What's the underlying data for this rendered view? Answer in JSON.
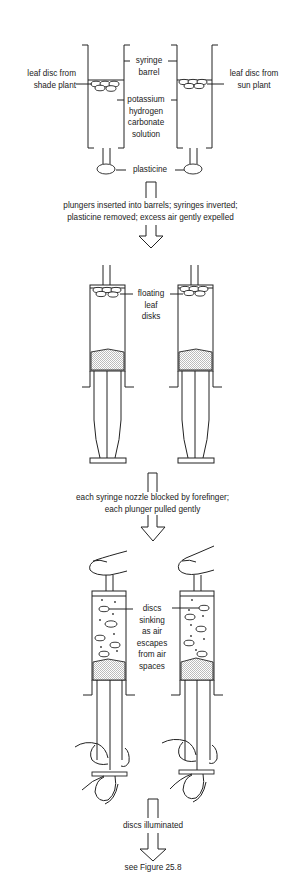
{
  "stage1": {
    "label_left_1": "leaf disc from",
    "label_left_2": "shade plant",
    "label_right_1": "leaf disc from",
    "label_right_2": "sun plant",
    "label_barrel_1": "syringe",
    "label_barrel_2": "barrel",
    "label_solution_1": "potassium",
    "label_solution_2": "hydrogen",
    "label_solution_3": "carbonate",
    "label_solution_4": "solution",
    "label_plasticine": "plasticine"
  },
  "step1": {
    "line1": "plungers inserted into barrels; syringes inverted;",
    "line2": "plasticine removed; excess air gently expelled"
  },
  "stage2": {
    "label_1": "floating",
    "label_2": "leaf",
    "label_3": "disks"
  },
  "step2": {
    "line1": "each syringe nozzle blocked by forefinger;",
    "line2": "each plunger pulled gently"
  },
  "stage3": {
    "label_1": "discs",
    "label_2": "sinking",
    "label_3": "as air",
    "label_4": "escapes",
    "label_5": "from air",
    "label_6": "spaces"
  },
  "step3": {
    "line1": "discs illuminated"
  },
  "footer": {
    "reference": "see Figure 25.8"
  },
  "colors": {
    "ink": "#222222",
    "background": "#ffffff"
  }
}
